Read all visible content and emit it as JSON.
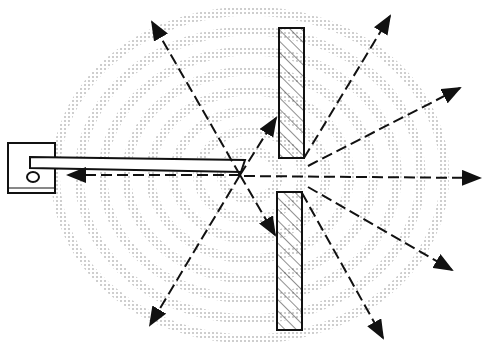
{
  "diagram": {
    "source": {
      "x": 240,
      "y": 175
    },
    "wave_rings": [
      30,
      55,
      80,
      105,
      130,
      155,
      180,
      205
    ],
    "colors": {
      "ink": "#111111",
      "dots": "#777777",
      "background": "#ffffff"
    },
    "barriers": [
      {
        "x": 279,
        "y": 28,
        "w": 25,
        "h": 130
      },
      {
        "x": 277,
        "y": 192,
        "w": 25,
        "h": 138
      }
    ],
    "rays": [
      {
        "x1": 240,
        "y1": 175,
        "x2": 152,
        "y2": 22
      },
      {
        "x1": 240,
        "y1": 175,
        "x2": 150,
        "y2": 325
      },
      {
        "x1": 240,
        "y1": 175,
        "x2": 276,
        "y2": 118
      },
      {
        "x1": 240,
        "y1": 175,
        "x2": 275,
        "y2": 235
      },
      {
        "x1": 240,
        "y1": 175,
        "x2": 68,
        "y2": 175
      },
      {
        "x1": 244,
        "y1": 176,
        "x2": 480,
        "y2": 178
      },
      {
        "x1": 304,
        "y1": 158,
        "x2": 390,
        "y2": 16
      },
      {
        "x1": 308,
        "y1": 166,
        "x2": 460,
        "y2": 88
      },
      {
        "x1": 308,
        "y1": 187,
        "x2": 452,
        "y2": 270
      },
      {
        "x1": 302,
        "y1": 193,
        "x2": 383,
        "y2": 338
      }
    ]
  }
}
